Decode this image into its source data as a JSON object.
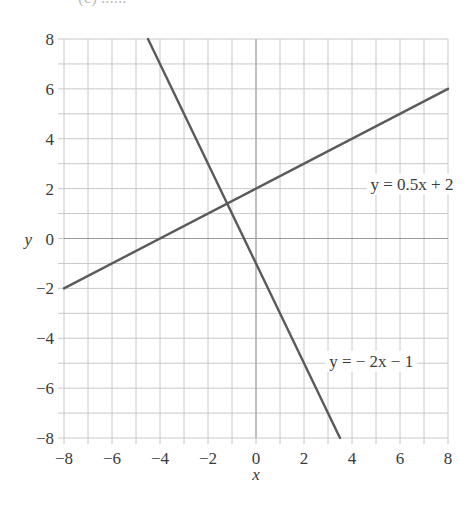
{
  "header_fragment": "(c) ......",
  "chart_data": {
    "type": "line",
    "title": "",
    "xlabel": "x",
    "ylabel": "y",
    "xlim": [
      -8,
      8
    ],
    "ylim": [
      -8,
      8
    ],
    "grid": true,
    "grid_step": 1,
    "x_ticks": [
      -8,
      -6,
      -4,
      -2,
      0,
      2,
      4,
      6,
      8
    ],
    "y_ticks": [
      -8,
      -6,
      -4,
      -2,
      0,
      2,
      4,
      6,
      8
    ],
    "x_tick_labels": [
      "−8",
      "−6",
      "−4",
      "−2",
      "0",
      "2",
      "4",
      "6",
      "8"
    ],
    "y_tick_labels": [
      "−8",
      "−6",
      "−4",
      "−2",
      "0",
      "2",
      "4",
      "6",
      "8"
    ],
    "series": [
      {
        "name": "y = 0.5x + 2",
        "label": "y = 0.5x + 2",
        "slope": 0.5,
        "intercept": 2,
        "x": [
          -8,
          8
        ],
        "y": [
          -2,
          6
        ],
        "label_pos": [
          6.5,
          2.2
        ]
      },
      {
        "name": "y = − 2x − 1",
        "label": "y = − 2x − 1",
        "slope": -2,
        "intercept": -1,
        "x": [
          -4.5,
          3.5
        ],
        "y": [
          8,
          -8
        ],
        "label_pos": [
          4.8,
          -4.9
        ]
      }
    ],
    "intersection": [
      -1.2,
      1.4
    ],
    "colors": {
      "grid": "#c8c8c8",
      "axis": "#9a9a9a",
      "line": "#5a5a5a",
      "text": "#3a3a3a"
    },
    "legend": "none"
  }
}
